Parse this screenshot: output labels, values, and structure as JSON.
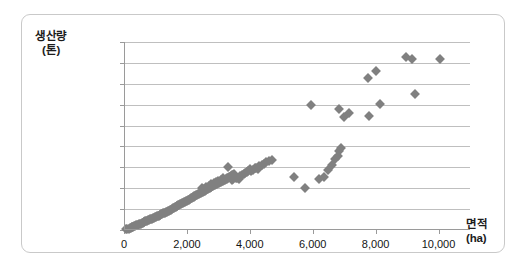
{
  "chart_data": {
    "type": "scatter",
    "title": "",
    "xlabel": "면적 (ha)",
    "ylabel": "생산량 (톤)",
    "xlabel_main": "면적",
    "xlabel_unit": "(ha)",
    "ylabel_main": "생산량",
    "ylabel_unit": "(톤)",
    "xlim": [
      0,
      11000
    ],
    "ylim": [
      0,
      900000
    ],
    "grid": true,
    "legend": false,
    "marker_color": "#808080",
    "marker_shape": "diamond",
    "gridline_color": "#bfbfbf",
    "xticks": [
      0,
      2000,
      4000,
      6000,
      8000,
      10000
    ],
    "xtick_labels": [
      "0",
      "2,000",
      "4,000",
      "6,000",
      "8,000",
      "10,000"
    ],
    "yticks": [
      0,
      100000,
      200000,
      300000,
      400000,
      500000,
      600000,
      700000,
      800000,
      900000
    ],
    "ytick_labels": [
      "0",
      "100,000",
      "200,000",
      "300,000",
      "400,000",
      "500,000",
      "600,000",
      "700,000",
      "800,000",
      "900,000"
    ],
    "points": [
      [
        60,
        3000
      ],
      [
        110,
        5500
      ],
      [
        150,
        7000
      ],
      [
        180,
        9000
      ],
      [
        210,
        11000
      ],
      [
        240,
        13000
      ],
      [
        270,
        14000
      ],
      [
        300,
        16000
      ],
      [
        330,
        18000
      ],
      [
        360,
        20000
      ],
      [
        390,
        22000
      ],
      [
        420,
        24000
      ],
      [
        450,
        26000
      ],
      [
        470,
        27000
      ],
      [
        500,
        29000
      ],
      [
        530,
        31000
      ],
      [
        560,
        33000
      ],
      [
        590,
        35000
      ],
      [
        620,
        37000
      ],
      [
        650,
        39000
      ],
      [
        680,
        41000
      ],
      [
        710,
        43000
      ],
      [
        740,
        45000
      ],
      [
        770,
        47000
      ],
      [
        800,
        49000
      ],
      [
        830,
        51000
      ],
      [
        860,
        53000
      ],
      [
        890,
        55000
      ],
      [
        920,
        57000
      ],
      [
        950,
        59000
      ],
      [
        980,
        61000
      ],
      [
        1010,
        63000
      ],
      [
        1040,
        65000
      ],
      [
        1070,
        67000
      ],
      [
        1100,
        69000
      ],
      [
        1130,
        71000
      ],
      [
        1160,
        73000
      ],
      [
        1190,
        75000
      ],
      [
        1220,
        77000
      ],
      [
        1250,
        79000
      ],
      [
        1280,
        81000
      ],
      [
        1310,
        83000
      ],
      [
        1340,
        85000
      ],
      [
        1370,
        87000
      ],
      [
        1400,
        89000
      ],
      [
        1430,
        92000
      ],
      [
        1460,
        95000
      ],
      [
        1490,
        97000
      ],
      [
        1520,
        100000
      ],
      [
        1550,
        103000
      ],
      [
        1580,
        105000
      ],
      [
        1610,
        108000
      ],
      [
        1640,
        110000
      ],
      [
        1670,
        113000
      ],
      [
        1700,
        115000
      ],
      [
        1730,
        118000
      ],
      [
        1760,
        120000
      ],
      [
        1790,
        123000
      ],
      [
        1820,
        126000
      ],
      [
        1850,
        128000
      ],
      [
        1880,
        131000
      ],
      [
        1910,
        133000
      ],
      [
        1940,
        136000
      ],
      [
        1970,
        139000
      ],
      [
        2000,
        141000
      ],
      [
        2030,
        144000
      ],
      [
        2060,
        146000
      ],
      [
        2090,
        149000
      ],
      [
        2120,
        152000
      ],
      [
        2150,
        154000
      ],
      [
        2180,
        157000
      ],
      [
        2210,
        159000
      ],
      [
        2240,
        162000
      ],
      [
        2270,
        164000
      ],
      [
        2300,
        167000
      ],
      [
        2330,
        169000
      ],
      [
        2360,
        172000
      ],
      [
        2390,
        174000
      ],
      [
        2420,
        177000
      ],
      [
        2450,
        179000
      ],
      [
        2480,
        182000
      ],
      [
        2510,
        184000
      ],
      [
        2540,
        187000
      ],
      [
        2570,
        189000
      ],
      [
        2600,
        192000
      ],
      [
        2630,
        194000
      ],
      [
        2660,
        196000
      ],
      [
        2690,
        199000
      ],
      [
        2720,
        201000
      ],
      [
        2750,
        204000
      ],
      [
        2780,
        206000
      ],
      [
        2810,
        209000
      ],
      [
        2840,
        211000
      ],
      [
        2870,
        214000
      ],
      [
        2900,
        216000
      ],
      [
        2930,
        219000
      ],
      [
        2960,
        221000
      ],
      [
        2990,
        224000
      ],
      [
        3020,
        226000
      ],
      [
        3050,
        229000
      ],
      [
        3080,
        231000
      ],
      [
        3110,
        234000
      ],
      [
        3140,
        236000
      ],
      [
        3170,
        239000
      ],
      [
        3200,
        241000
      ],
      [
        3230,
        244000
      ],
      [
        3260,
        246000
      ],
      [
        3290,
        249000
      ],
      [
        3320,
        251000
      ],
      [
        3350,
        254000
      ],
      [
        3380,
        256000
      ],
      [
        3410,
        259000
      ],
      [
        3440,
        261000
      ],
      [
        3470,
        264000
      ],
      [
        3500,
        266000
      ],
      [
        3300,
        302000
      ],
      [
        3420,
        238000
      ],
      [
        3480,
        245000
      ],
      [
        3530,
        255000
      ],
      [
        3560,
        248000
      ],
      [
        3600,
        251000
      ],
      [
        3650,
        243000
      ],
      [
        3700,
        258000
      ],
      [
        3750,
        262000
      ],
      [
        3800,
        268000
      ],
      [
        3850,
        272000
      ],
      [
        3900,
        277000
      ],
      [
        3950,
        284000
      ],
      [
        4000,
        290000
      ],
      [
        4050,
        281000
      ],
      [
        4100,
        288000
      ],
      [
        4150,
        295000
      ],
      [
        4200,
        299000
      ],
      [
        4250,
        292000
      ],
      [
        4300,
        305000
      ],
      [
        4400,
        312000
      ],
      [
        4450,
        318000
      ],
      [
        4500,
        327000
      ],
      [
        4600,
        332000
      ],
      [
        4700,
        335000
      ],
      [
        2480,
        203000
      ],
      [
        2550,
        198000
      ],
      [
        2620,
        207000
      ],
      [
        2700,
        212000
      ],
      [
        2780,
        218000
      ],
      [
        2850,
        223000
      ],
      [
        2920,
        228000
      ],
      [
        3000,
        233000
      ],
      [
        3080,
        240000
      ],
      [
        3150,
        247000
      ],
      [
        5400,
        252000
      ],
      [
        5750,
        203000
      ],
      [
        5950,
        598000
      ],
      [
        6200,
        243000
      ],
      [
        6350,
        255000
      ],
      [
        6500,
        288000
      ],
      [
        6600,
        310000
      ],
      [
        6700,
        338000
      ],
      [
        6800,
        355000
      ],
      [
        6850,
        380000
      ],
      [
        6900,
        393000
      ],
      [
        6850,
        580000
      ],
      [
        7000,
        540000
      ],
      [
        7150,
        558000
      ],
      [
        7750,
        728000
      ],
      [
        7800,
        545000
      ],
      [
        8000,
        760000
      ],
      [
        8150,
        605000
      ],
      [
        8950,
        830000
      ],
      [
        9150,
        820000
      ],
      [
        9250,
        650000
      ],
      [
        10050,
        818000
      ]
    ]
  }
}
